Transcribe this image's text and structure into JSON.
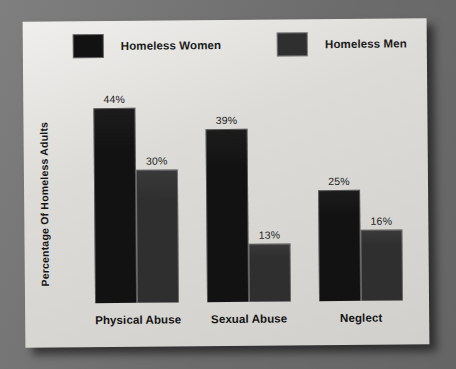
{
  "background": {
    "color": "#787878"
  },
  "card": {
    "color": "#dcdbd7"
  },
  "legend": {
    "items": [
      {
        "label": "Homeless Women",
        "color": "#121212",
        "icon": "legend-swatch-icon"
      },
      {
        "label": "Homeless Men",
        "color": "#2f2f2f",
        "icon": "legend-swatch-icon"
      }
    ]
  },
  "chart_data": {
    "type": "bar",
    "title": "",
    "xlabel": "",
    "ylabel": "Percentage Of Homeless Adults",
    "ylim": [
      0,
      50
    ],
    "grid": false,
    "legend_position": "top",
    "value_suffix": "%",
    "categories": [
      "Physical Abuse",
      "Sexual Abuse",
      "Neglect"
    ],
    "series": [
      {
        "name": "Homeless Women",
        "color": "#121212",
        "values": [
          44,
          39,
          25
        ],
        "labels": [
          "44%",
          "39%",
          "25%"
        ]
      },
      {
        "name": "Homeless Men",
        "color": "#2f2f2f",
        "values": [
          30,
          13,
          16
        ],
        "labels": [
          "30%",
          "13%",
          "16%"
        ]
      }
    ]
  }
}
